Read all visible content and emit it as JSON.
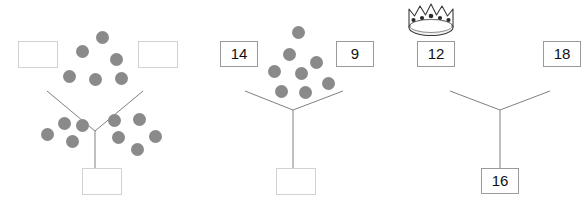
{
  "worksheet": {
    "title": "Number bond trees worksheet",
    "dot_color": "#8a8a8a",
    "line_color": "#808080",
    "box_border_color": "#9a9a9a",
    "empty_box_border_color": "#d2d2d2",
    "text_color": "#111111"
  },
  "trees": [
    {
      "id": "tree-1",
      "left_box": {
        "value": "",
        "empty": true
      },
      "right_box": {
        "value": "",
        "empty": true
      },
      "bottom_box": {
        "value": "",
        "empty": true
      },
      "crown": false,
      "top_dot_count": 6,
      "bottom_left_dot_count": 4,
      "bottom_right_dot_count": 5,
      "top_dots": [
        {
          "x": 96,
          "y": 31
        },
        {
          "x": 76,
          "y": 45
        },
        {
          "x": 110,
          "y": 53
        },
        {
          "x": 63,
          "y": 70
        },
        {
          "x": 89,
          "y": 73
        },
        {
          "x": 115,
          "y": 72
        }
      ],
      "bottom_dots": [
        {
          "x": 58,
          "y": 117
        },
        {
          "x": 76,
          "y": 119
        },
        {
          "x": 41,
          "y": 128
        },
        {
          "x": 66,
          "y": 135
        },
        {
          "x": 108,
          "y": 114
        },
        {
          "x": 133,
          "y": 113
        },
        {
          "x": 112,
          "y": 131
        },
        {
          "x": 149,
          "y": 130
        },
        {
          "x": 131,
          "y": 143
        }
      ]
    },
    {
      "id": "tree-2",
      "left_box": {
        "value": "14",
        "empty": false
      },
      "right_box": {
        "value": "9",
        "empty": false
      },
      "bottom_box": {
        "value": "",
        "empty": true
      },
      "crown": false,
      "top_dot_count": 9,
      "bottom_left_dot_count": 0,
      "bottom_right_dot_count": 0,
      "top_dots": [
        {
          "x": 92,
          "y": 26
        },
        {
          "x": 83,
          "y": 48
        },
        {
          "x": 110,
          "y": 56
        },
        {
          "x": 68,
          "y": 65
        },
        {
          "x": 95,
          "y": 67
        },
        {
          "x": 122,
          "y": 77
        },
        {
          "x": 75,
          "y": 85
        },
        {
          "x": 99,
          "y": 86
        }
      ],
      "bottom_dots": []
    },
    {
      "id": "tree-3",
      "left_box": {
        "value": "12",
        "empty": false
      },
      "right_box": {
        "value": "18",
        "empty": false
      },
      "bottom_box": {
        "value": "16",
        "empty": false
      },
      "crown": true,
      "crown_icon": "crown-icon",
      "crown_jewel_count": 5,
      "crown_point_count": 5,
      "top_dot_count": 0,
      "bottom_left_dot_count": 0,
      "bottom_right_dot_count": 0,
      "top_dots": [],
      "bottom_dots": []
    }
  ]
}
